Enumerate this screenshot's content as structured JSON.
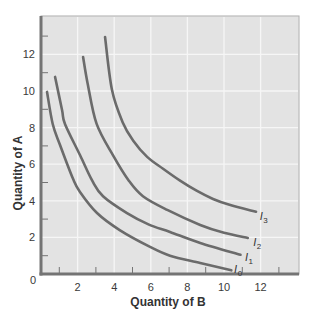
{
  "chart_data": {
    "type": "line",
    "title": "",
    "xlabel": "Quantity of B",
    "ylabel": "Quantity of A",
    "xlim": [
      0,
      14.1
    ],
    "ylim": [
      0,
      14.1
    ],
    "x_ticks": [
      2,
      4,
      6,
      8,
      10,
      12
    ],
    "y_ticks": [
      2,
      4,
      6,
      8,
      10,
      12
    ],
    "origin_label": "0",
    "minor_tick_marks": [
      1,
      3,
      5,
      7,
      9,
      11,
      13
    ],
    "grid": true,
    "legend": "none (curves labeled directly)",
    "series": [
      {
        "name": "I0",
        "label_main": "I",
        "label_sub": "0",
        "label_pos": [
          10.55,
          0.05
        ],
        "points": [
          [
            0.33,
            9.95
          ],
          [
            0.64,
            8.2
          ],
          [
            1.04,
            7.05
          ],
          [
            1.75,
            5.2
          ],
          [
            2.13,
            4.48
          ],
          [
            3.06,
            3.33
          ],
          [
            4.3,
            2.4
          ],
          [
            5.96,
            1.48
          ],
          [
            7.05,
            1.0
          ],
          [
            8.7,
            0.6
          ],
          [
            10.4,
            0.2
          ]
        ]
      },
      {
        "name": "I1",
        "label_main": "I",
        "label_sub": "1",
        "label_pos": [
          11.15,
          0.72
        ],
        "points": [
          [
            0.77,
            10.77
          ],
          [
            1.15,
            8.96
          ],
          [
            1.31,
            8.2
          ],
          [
            2.13,
            6.5
          ],
          [
            2.8,
            5.1
          ],
          [
            3.39,
            4.25
          ],
          [
            4.7,
            3.33
          ],
          [
            5.9,
            2.7
          ],
          [
            7.05,
            2.3
          ],
          [
            8.7,
            1.7
          ],
          [
            10.9,
            1.05
          ]
        ]
      },
      {
        "name": "I2",
        "label_main": "I",
        "label_sub": "2",
        "label_pos": [
          11.6,
          1.55
        ],
        "points": [
          [
            2.3,
            11.86
          ],
          [
            2.55,
            10.4
          ],
          [
            3.04,
            8.2
          ],
          [
            3.93,
            6.5
          ],
          [
            4.8,
            5.1
          ],
          [
            5.57,
            4.25
          ],
          [
            6.9,
            3.5
          ],
          [
            8.7,
            2.68
          ],
          [
            10.0,
            2.25
          ],
          [
            11.3,
            1.97
          ]
        ]
      },
      {
        "name": "I3",
        "label_main": "I",
        "label_sub": "3",
        "label_pos": [
          11.95,
          2.95
        ],
        "points": [
          [
            3.5,
            12.95
          ],
          [
            3.88,
            10.05
          ],
          [
            4.48,
            8.25
          ],
          [
            5.03,
            7.3
          ],
          [
            5.8,
            6.4
          ],
          [
            6.67,
            5.75
          ],
          [
            7.6,
            5.1
          ],
          [
            8.5,
            4.55
          ],
          [
            9.4,
            4.1
          ],
          [
            10.3,
            3.78
          ],
          [
            11.75,
            3.4
          ]
        ]
      }
    ]
  },
  "colors": {
    "plot_background": "#e3e3e3",
    "gridline": "#f6f6f6",
    "axis": "#747474",
    "frame": "#b0b0b0",
    "curve": "#6b6b6b",
    "text": "#333333"
  }
}
